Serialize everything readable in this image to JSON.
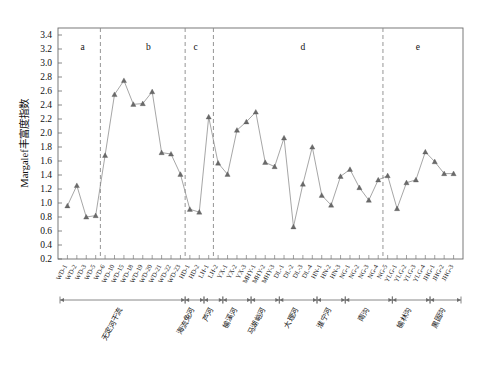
{
  "chart_data": {
    "type": "line",
    "title": "",
    "subtitle": "",
    "xlabel": "",
    "ylabel": "Margalef丰富度指数",
    "ylim": [
      0.2,
      3.5
    ],
    "ytick_values": [
      0.2,
      0.4,
      0.6,
      0.8,
      1.0,
      1.2,
      1.4,
      1.6,
      1.8,
      2.0,
      2.2,
      2.4,
      2.6,
      2.8,
      3.0,
      3.2,
      3.4
    ],
    "ytick_labels": [
      "0.2",
      "0.4",
      "0.6",
      "0.8",
      "1.0",
      "1.2",
      "1.4",
      "1.6",
      "1.8",
      "2.0",
      "2.2",
      "2.4",
      "2.6",
      "2.8",
      "3.0",
      "3.2",
      "3.4"
    ],
    "grid": false,
    "legend": null,
    "marker": "triangle",
    "categories": [
      "WD-1",
      "WD-2",
      "WD-3",
      "WD-5",
      "WD-6",
      "WD-10",
      "WD-15",
      "WD-18",
      "WD-19",
      "WD-20",
      "WD-21",
      "WD-22",
      "WD-23",
      "HD-1",
      "HD-2",
      "LH-1",
      "LH-2",
      "YX-1",
      "YX-2",
      "YX-3",
      "MHY-1",
      "MHY-2",
      "MHY-3",
      "DL-1",
      "DL-2",
      "DL-3",
      "DL-4",
      "HN-1",
      "HN-2",
      "HN-3",
      "NG-1",
      "NG-2",
      "NG-3",
      "NG-4",
      "NG-5",
      "YLG-1",
      "YLG-2",
      "YLG-3",
      "YLG-4",
      "JHG-1",
      "JHG-2",
      "JHG-3"
    ],
    "xtick_labels": [
      "WD-1",
      "WD-2",
      "WD-3",
      "WD-5",
      "WD-6",
      "WD-10",
      "WD-15",
      "WD-18",
      "WD-19",
      "WD-20",
      "WD-21",
      "WD-22",
      "WD-23",
      "HD-1",
      "HD-2",
      "LH-1",
      "LH-2",
      "YX-1",
      "YX-2",
      "YX-3",
      "MHY-1",
      "MHY-2",
      "MHY-3",
      "DL-1",
      "DL-2",
      "DL-3",
      "DL-4",
      "HN-1",
      "HN-2",
      "HN-3",
      "NG-1",
      "NG-2",
      "NG-3",
      "NG-4",
      "NG-5",
      "YLG-1",
      "YLG-2",
      "YLG-3",
      "YLG-4",
      "JHG-1",
      "JHG-2",
      "JHG-3"
    ],
    "values": [
      0.96,
      1.25,
      0.8,
      0.82,
      1.68,
      2.55,
      2.75,
      2.41,
      2.42,
      2.59,
      1.72,
      1.7,
      1.41,
      0.91,
      0.87,
      2.23,
      1.57,
      1.41,
      2.04,
      2.16,
      2.3,
      1.58,
      1.52,
      1.93,
      0.66,
      1.27,
      1.8,
      1.11,
      0.97,
      1.38,
      1.48,
      1.22,
      1.04,
      1.33,
      1.39,
      0.92,
      1.29,
      1.33,
      1.73,
      1.59,
      1.42,
      1.42
    ],
    "group_letters": [
      {
        "label": "a",
        "x_index_center": 1.6
      },
      {
        "label": "b",
        "x_index_center": 8.6
      },
      {
        "label": "c",
        "x_index_center": 13.6
      },
      {
        "label": "d",
        "x_index_center": 25.0
      },
      {
        "label": "e",
        "x_index_center": 37.2
      }
    ],
    "group_dividers_after_index": [
      3,
      12,
      15,
      33
    ],
    "reaches": [
      {
        "name": "无定河干流",
        "start_index": 0,
        "end_index": 12
      },
      {
        "name": "海流兔河",
        "start_index": 13,
        "end_index": 14
      },
      {
        "name": "芦河",
        "start_index": 15,
        "end_index": 16
      },
      {
        "name": "榆溪河",
        "start_index": 17,
        "end_index": 19
      },
      {
        "name": "马湖峪河",
        "start_index": 20,
        "end_index": 22
      },
      {
        "name": "大理河",
        "start_index": 23,
        "end_index": 26
      },
      {
        "name": "淮宁河",
        "start_index": 27,
        "end_index": 29
      },
      {
        "name": "南沟",
        "start_index": 30,
        "end_index": 34
      },
      {
        "name": "榆林沟",
        "start_index": 35,
        "end_index": 38
      },
      {
        "name": "黑固沟",
        "start_index": 39,
        "end_index": 41
      }
    ],
    "colors": {
      "line": "#8f8f8f",
      "marker": "#6a6a6a",
      "axis": "#6b6b6b",
      "divider": "#8a8a8a",
      "text": "#111111",
      "background": "#ffffff"
    }
  }
}
